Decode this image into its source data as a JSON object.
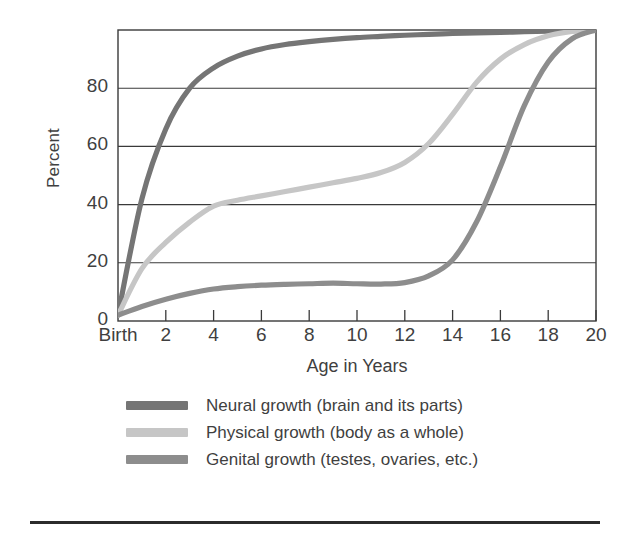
{
  "axes": {
    "y_title": "Percent",
    "x_title": "Age in Years",
    "y_ticks": [
      "80",
      "60",
      "40",
      "20",
      "0"
    ],
    "x_ticks": [
      "Birth",
      "2",
      "4",
      "6",
      "8",
      "10",
      "12",
      "14",
      "16",
      "18",
      "20"
    ]
  },
  "legend": {
    "items": [
      {
        "label": "Neural growth (brain and its parts)",
        "color": "#757575"
      },
      {
        "label": "Physical growth (body as a whole)",
        "color": "#c6c6c6"
      },
      {
        "label": "Genital growth (testes, ovaries, etc.)",
        "color": "#8d8d8d"
      }
    ]
  },
  "chart_data": {
    "type": "line",
    "title": "",
    "xlabel": "Age in Years",
    "ylabel": "Percent",
    "xlim": [
      0,
      20
    ],
    "ylim": [
      0,
      100
    ],
    "grid": true,
    "gridlines_y": [
      20,
      40,
      60,
      80
    ],
    "xtick_values": [
      0,
      2,
      4,
      6,
      8,
      10,
      12,
      14,
      16,
      18,
      20
    ],
    "xtick_labels": [
      "Birth",
      "2",
      "4",
      "6",
      "8",
      "10",
      "12",
      "14",
      "16",
      "18",
      "20"
    ],
    "ytick_values": [
      0,
      20,
      40,
      60,
      80
    ],
    "legend_position": "below",
    "x": [
      0,
      1,
      2,
      3,
      4,
      5,
      6,
      7,
      8,
      9,
      10,
      11,
      12,
      13,
      14,
      15,
      16,
      17,
      18,
      19,
      20
    ],
    "series": [
      {
        "name": "Neural growth (brain and its parts)",
        "color": "#757575",
        "values": [
          2,
          42,
          66,
          80,
          87,
          91,
          93.5,
          95,
          96,
          96.8,
          97.4,
          97.8,
          98.2,
          98.5,
          98.8,
          99,
          99.2,
          99.4,
          99.6,
          99.8,
          100
        ]
      },
      {
        "name": "Physical growth (body as a whole)",
        "color": "#c6c6c6",
        "values": [
          2,
          18,
          27,
          34,
          39.5,
          41.5,
          43,
          44.5,
          46,
          47.5,
          49,
          51,
          54.5,
          61,
          71,
          82,
          90,
          95,
          98,
          99.5,
          100
        ]
      },
      {
        "name": "Genital growth (testes, ovaries, etc.)",
        "color": "#8d8d8d",
        "values": [
          2,
          5,
          7.5,
          9.5,
          11,
          11.8,
          12.3,
          12.6,
          12.8,
          13,
          12.8,
          12.7,
          13.2,
          15.5,
          21,
          34,
          53,
          74,
          89,
          97,
          100
        ]
      }
    ]
  }
}
